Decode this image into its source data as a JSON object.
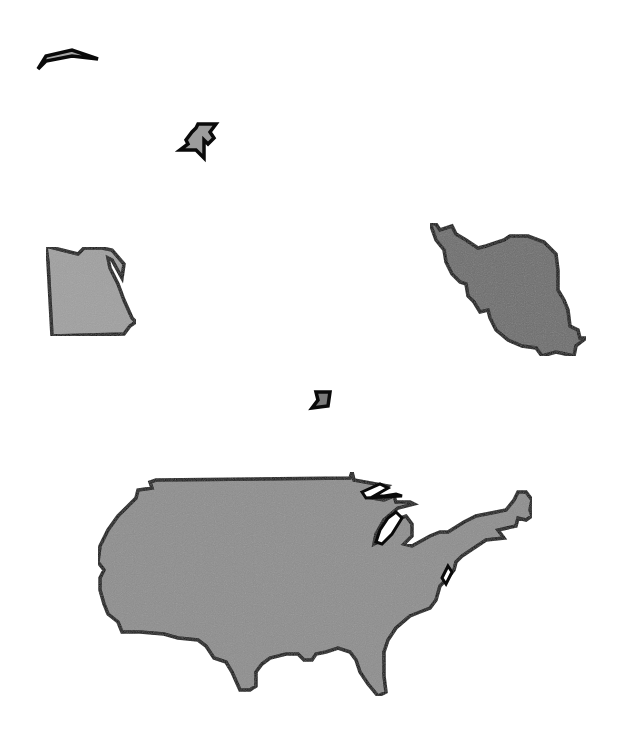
{
  "figure": {
    "background": "#ffffff",
    "outline_color": "#0a0a0a",
    "shapes": [
      {
        "name": "fragment-top-left",
        "fill": "#a8a8a8"
      },
      {
        "name": "fragment-star",
        "fill": "#9c9c9c"
      },
      {
        "name": "egypt",
        "fill": "#a0a0a0"
      },
      {
        "name": "iran",
        "fill": "#6e6e6e"
      },
      {
        "name": "fragment-small",
        "fill": "#7a7a7a"
      },
      {
        "name": "usa",
        "fill": "#8e8e8e"
      }
    ]
  }
}
